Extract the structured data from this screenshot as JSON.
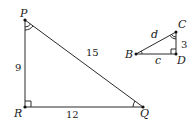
{
  "diagram": {
    "large_triangle": {
      "vertices": {
        "P": "P",
        "R": "R",
        "Q": "Q"
      },
      "sides": {
        "PR": "9",
        "RQ": "12",
        "PQ": "15"
      },
      "right_angle_at": "R",
      "angle_marks": {
        "P": "double-arc",
        "Q": "single-arc"
      }
    },
    "small_triangle": {
      "vertices": {
        "B": "B",
        "C": "C",
        "D": "D"
      },
      "sides": {
        "BC": "d",
        "CD": "3",
        "BD": "c"
      },
      "right_angle_at": "D",
      "angle_marks": {
        "B": "single-arc",
        "C": "double-arc"
      }
    }
  }
}
